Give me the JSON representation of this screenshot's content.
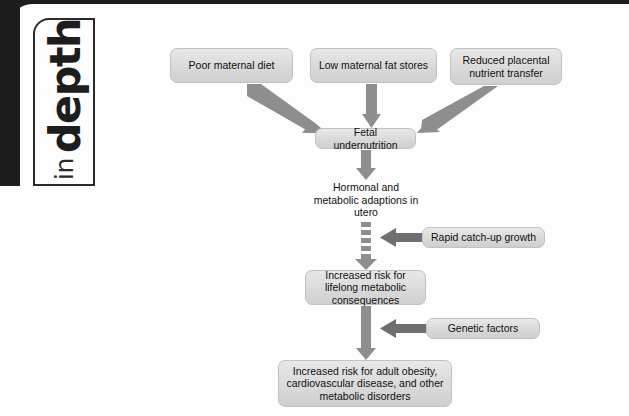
{
  "logo": {
    "word_small": "in",
    "word_large": "depth"
  },
  "diagram": {
    "type": "flowchart",
    "orientation": "top-to-bottom",
    "arrow_color": "#8c8c8c",
    "node_fill": "#dcdcdc",
    "nodes": [
      {
        "id": "poor-maternal-diet",
        "label": "Poor maternal diet",
        "x": 170,
        "y": 48,
        "w": 123,
        "h": 35,
        "boxed": true
      },
      {
        "id": "low-maternal-fat-stores",
        "label": "Low maternal fat stores",
        "x": 310,
        "y": 48,
        "w": 127,
        "h": 35,
        "boxed": true
      },
      {
        "id": "reduced-placental",
        "label": "Reduced placental nutrient transfer",
        "x": 450,
        "y": 48,
        "w": 112,
        "h": 37,
        "boxed": true
      },
      {
        "id": "fetal-undernutrition",
        "label": "Fetal undernutrition",
        "x": 315,
        "y": 128,
        "w": 101,
        "h": 21,
        "boxed": true
      },
      {
        "id": "hormonal-metabolic",
        "label": "Hormonal and metabolic adaptions in utero",
        "x": 310,
        "y": 181,
        "w": 112,
        "h": 40,
        "boxed": false
      },
      {
        "id": "rapid-catch-up-growth",
        "label": "Rapid catch-up growth",
        "x": 422,
        "y": 227,
        "w": 123,
        "h": 21,
        "boxed": true
      },
      {
        "id": "increased-risk-lifelong",
        "label": "Increased risk for lifelong metabolic consequences",
        "x": 305,
        "y": 270,
        "w": 121,
        "h": 35,
        "boxed": true
      },
      {
        "id": "genetic-factors",
        "label": "Genetic factors",
        "x": 426,
        "y": 318,
        "w": 114,
        "h": 21,
        "boxed": true
      },
      {
        "id": "increased-risk-adult",
        "label": "Increased risk for adult obesity, cardiovascular disease, and other metabolic disorders",
        "x": 278,
        "y": 360,
        "w": 174,
        "h": 47,
        "boxed": true
      }
    ],
    "edges": [
      {
        "id": "edge-diet-to-fetal",
        "from": "poor-maternal-diet",
        "to": "fetal-undernutrition",
        "style": "solid",
        "direction": "down-right"
      },
      {
        "id": "edge-fat-to-fetal",
        "from": "low-maternal-fat-stores",
        "to": "fetal-undernutrition",
        "style": "solid",
        "direction": "down"
      },
      {
        "id": "edge-placental-to-fetal",
        "from": "reduced-placental",
        "to": "fetal-undernutrition",
        "style": "solid",
        "direction": "down-left"
      },
      {
        "id": "edge-fetal-to-hormonal",
        "from": "fetal-undernutrition",
        "to": "hormonal-metabolic",
        "style": "solid",
        "direction": "down"
      },
      {
        "id": "edge-hormonal-to-lifelong",
        "from": "hormonal-metabolic",
        "to": "increased-risk-lifelong",
        "style": "dashed",
        "direction": "down"
      },
      {
        "id": "edge-catchup-to-chain",
        "from": "rapid-catch-up-growth",
        "to": "edge-hormonal-to-lifelong",
        "style": "solid",
        "direction": "left"
      },
      {
        "id": "edge-lifelong-to-adult",
        "from": "increased-risk-lifelong",
        "to": "increased-risk-adult",
        "style": "solid",
        "direction": "down"
      },
      {
        "id": "edge-genetic-to-chain",
        "from": "genetic-factors",
        "to": "edge-lifelong-to-adult",
        "style": "solid",
        "direction": "left"
      }
    ]
  }
}
